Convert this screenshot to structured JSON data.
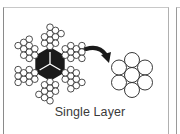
{
  "figure": {
    "caption": "Single Layer",
    "left_item": "multi-strand-rope-cross-section",
    "right_item": "single-layer-7-wire-strand",
    "connector": "curved-arrow",
    "colors": {
      "wire_fill": "#ffffff",
      "wire_stroke": "#222222",
      "core_fill": "#1a1a1a",
      "arrow": "#1a1a1a",
      "caption_text": "#3a3a3a"
    }
  }
}
